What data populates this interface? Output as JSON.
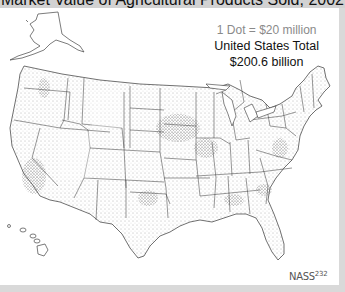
{
  "title": "Market Value of Agricultural Products Sold, 2002",
  "legend": {
    "dot_scale": "1 Dot = $20 million",
    "total_label": "United States Total",
    "total_value": "$200.6 billion"
  },
  "credit": {
    "source": "NASS",
    "number": "232"
  },
  "map": {
    "region": "United States",
    "insets": [
      "Alaska",
      "Hawaii"
    ],
    "style": "dot density",
    "dot_color": "#555555",
    "boundary_color": "#333333",
    "background": "#ffffff"
  }
}
